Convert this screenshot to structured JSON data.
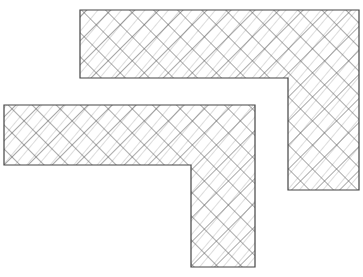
{
  "diagram": {
    "type": "hatched-l-shapes",
    "background": "#ffffff",
    "stroke_color": "#444444",
    "hatch_color": "#555555",
    "hatch_spacing": 12,
    "shapes": [
      {
        "name": "upper-l-shape",
        "outline": [
          [
            80,
            10
          ],
          [
            359,
            10
          ],
          [
            359,
            190
          ],
          [
            288,
            190
          ],
          [
            288,
            78
          ],
          [
            80,
            78
          ]
        ]
      },
      {
        "name": "lower-l-shape",
        "outline": [
          [
            4,
            105
          ],
          [
            255,
            105
          ],
          [
            255,
            267
          ],
          [
            191,
            267
          ],
          [
            191,
            165
          ],
          [
            4,
            165
          ]
        ]
      }
    ]
  }
}
